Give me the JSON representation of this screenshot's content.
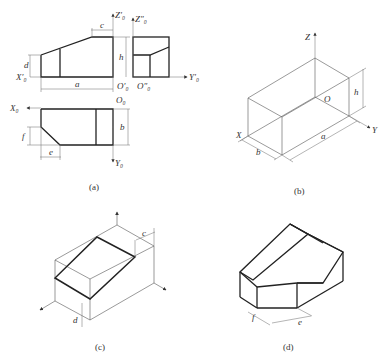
{
  "figure": {
    "panels": [
      {
        "id": "a",
        "caption": "(a)",
        "description": "Three-view orthographic projection (front, side, top)"
      },
      {
        "id": "b",
        "caption": "(b)",
        "description": "Isometric bounding box with axes X, Y, Z and origin O"
      },
      {
        "id": "c",
        "caption": "(c)",
        "description": "Isometric box with cut plane located by c and d"
      },
      {
        "id": "d",
        "caption": "(d)",
        "description": "Final isometric drawing with chamfer dimensions f and e"
      }
    ],
    "labels": {
      "a": {
        "z0_prime": "Z′₀",
        "z0_dprime": "Z″₀",
        "x0_prime": "X′₀",
        "y0_prime": "Y′₀",
        "o0_prime": "O′₀",
        "o0_dprime": "O″₀",
        "x0": "X₀",
        "o0": "O₀",
        "y0": "Y₀",
        "dim_c": "c",
        "dim_d": "d",
        "dim_h": "h",
        "dim_a": "a",
        "dim_f": "f",
        "dim_e": "e",
        "dim_b": "b"
      },
      "b": {
        "z": "Z",
        "x": "X",
        "y": "Y",
        "o": "O",
        "dim_h": "h",
        "dim_a": "a",
        "dim_b": "b"
      },
      "c": {
        "dim_c": "c",
        "dim_d": "d"
      },
      "d": {
        "dim_f": "f",
        "dim_e": "e"
      }
    }
  }
}
